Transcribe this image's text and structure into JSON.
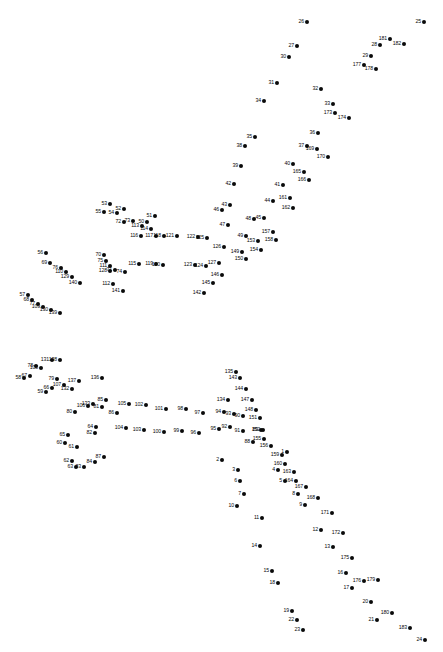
{
  "puzzle": {
    "title": "Connect the Dots",
    "dot_count": 183,
    "dot_color": "#0a0a0a",
    "background_color": "#ffffff",
    "label_color": "#0a0a0a",
    "width": 443,
    "height": 652,
    "dots": [
      {
        "n": "1",
        "x": 287,
        "y": 452,
        "pos": "l"
      },
      {
        "n": "2",
        "x": 222,
        "y": 460,
        "pos": "l"
      },
      {
        "n": "3",
        "x": 238,
        "y": 470,
        "pos": "l"
      },
      {
        "n": "4",
        "x": 278,
        "y": 470,
        "pos": "l"
      },
      {
        "n": "5",
        "x": 285,
        "y": 481,
        "pos": "l"
      },
      {
        "n": "6",
        "x": 240,
        "y": 481,
        "pos": "l"
      },
      {
        "n": "7",
        "x": 244,
        "y": 494,
        "pos": "l"
      },
      {
        "n": "8",
        "x": 298,
        "y": 494,
        "pos": "l"
      },
      {
        "n": "9",
        "x": 305,
        "y": 505,
        "pos": "l"
      },
      {
        "n": "10",
        "x": 237,
        "y": 506,
        "pos": "l"
      },
      {
        "n": "11",
        "x": 262,
        "y": 518,
        "pos": "l"
      },
      {
        "n": "12",
        "x": 321,
        "y": 530,
        "pos": "l"
      },
      {
        "n": "13",
        "x": 333,
        "y": 547,
        "pos": "l"
      },
      {
        "n": "14",
        "x": 260,
        "y": 546,
        "pos": "l"
      },
      {
        "n": "15",
        "x": 272,
        "y": 571,
        "pos": "l"
      },
      {
        "n": "16",
        "x": 346,
        "y": 573,
        "pos": "l"
      },
      {
        "n": "17",
        "x": 352,
        "y": 588,
        "pos": "l"
      },
      {
        "n": "18",
        "x": 278,
        "y": 583,
        "pos": "l"
      },
      {
        "n": "19",
        "x": 292,
        "y": 611,
        "pos": "l"
      },
      {
        "n": "20",
        "x": 371,
        "y": 602,
        "pos": "l"
      },
      {
        "n": "21",
        "x": 377,
        "y": 620,
        "pos": "l"
      },
      {
        "n": "22",
        "x": 297,
        "y": 620,
        "pos": "l"
      },
      {
        "n": "23",
        "x": 303,
        "y": 630,
        "pos": "l"
      },
      {
        "n": "24",
        "x": 425,
        "y": 640,
        "pos": "l"
      },
      {
        "n": "25",
        "x": 424,
        "y": 22,
        "pos": "l"
      },
      {
        "n": "26",
        "x": 307,
        "y": 22,
        "pos": "l"
      },
      {
        "n": "27",
        "x": 297,
        "y": 46,
        "pos": "l"
      },
      {
        "n": "28",
        "x": 380,
        "y": 45,
        "pos": "l"
      },
      {
        "n": "29",
        "x": 371,
        "y": 56,
        "pos": "l"
      },
      {
        "n": "30",
        "x": 289,
        "y": 57,
        "pos": "l"
      },
      {
        "n": "31",
        "x": 277,
        "y": 83,
        "pos": "l"
      },
      {
        "n": "32",
        "x": 321,
        "y": 89,
        "pos": "l"
      },
      {
        "n": "33",
        "x": 333,
        "y": 104,
        "pos": "l"
      },
      {
        "n": "34",
        "x": 264,
        "y": 101,
        "pos": "l"
      },
      {
        "n": "35",
        "x": 255,
        "y": 137,
        "pos": "l"
      },
      {
        "n": "36",
        "x": 318,
        "y": 133,
        "pos": "l"
      },
      {
        "n": "37",
        "x": 307,
        "y": 146,
        "pos": "l"
      },
      {
        "n": "38",
        "x": 245,
        "y": 146,
        "pos": "l"
      },
      {
        "n": "39",
        "x": 241,
        "y": 166,
        "pos": "l"
      },
      {
        "n": "40",
        "x": 293,
        "y": 164,
        "pos": "l"
      },
      {
        "n": "41",
        "x": 283,
        "y": 185,
        "pos": "l"
      },
      {
        "n": "42",
        "x": 234,
        "y": 184,
        "pos": "l"
      },
      {
        "n": "43",
        "x": 230,
        "y": 205,
        "pos": "l"
      },
      {
        "n": "44",
        "x": 273,
        "y": 201,
        "pos": "l"
      },
      {
        "n": "45",
        "x": 264,
        "y": 218,
        "pos": "l"
      },
      {
        "n": "46",
        "x": 222,
        "y": 210,
        "pos": "l"
      },
      {
        "n": "47",
        "x": 228,
        "y": 225,
        "pos": "l"
      },
      {
        "n": "48",
        "x": 254,
        "y": 219,
        "pos": "l"
      },
      {
        "n": "49",
        "x": 246,
        "y": 236,
        "pos": "l"
      },
      {
        "n": "50",
        "x": 147,
        "y": 222,
        "pos": "l"
      },
      {
        "n": "51",
        "x": 155,
        "y": 216,
        "pos": "l"
      },
      {
        "n": "52",
        "x": 124,
        "y": 209,
        "pos": "l"
      },
      {
        "n": "53",
        "x": 110,
        "y": 204,
        "pos": "l"
      },
      {
        "n": "54",
        "x": 117,
        "y": 213,
        "pos": "l"
      },
      {
        "n": "55",
        "x": 104,
        "y": 212,
        "pos": "l"
      },
      {
        "n": "56",
        "x": 46,
        "y": 253,
        "pos": "l"
      },
      {
        "n": "57",
        "x": 28,
        "y": 295,
        "pos": "l"
      },
      {
        "n": "58",
        "x": 24,
        "y": 378,
        "pos": "l"
      },
      {
        "n": "59",
        "x": 46,
        "y": 392,
        "pos": "l"
      },
      {
        "n": "60",
        "x": 65,
        "y": 443,
        "pos": "l"
      },
      {
        "n": "61",
        "x": 77,
        "y": 447,
        "pos": "l"
      },
      {
        "n": "62",
        "x": 72,
        "y": 461,
        "pos": "l"
      },
      {
        "n": "63",
        "x": 76,
        "y": 467,
        "pos": "l"
      },
      {
        "n": "64",
        "x": 96,
        "y": 427,
        "pos": "l"
      },
      {
        "n": "65",
        "x": 68,
        "y": 435,
        "pos": "l"
      },
      {
        "n": "66",
        "x": 52,
        "y": 388,
        "pos": "l"
      },
      {
        "n": "67",
        "x": 30,
        "y": 376,
        "pos": "l"
      },
      {
        "n": "68",
        "x": 32,
        "y": 300,
        "pos": "l"
      },
      {
        "n": "69",
        "x": 50,
        "y": 263,
        "pos": "l"
      },
      {
        "n": "70",
        "x": 104,
        "y": 255,
        "pos": "l"
      },
      {
        "n": "71",
        "x": 115,
        "y": 270,
        "pos": "l"
      },
      {
        "n": "72",
        "x": 124,
        "y": 222,
        "pos": "l"
      },
      {
        "n": "73",
        "x": 133,
        "y": 221,
        "pos": "l"
      },
      {
        "n": "74",
        "x": 125,
        "y": 272,
        "pos": "l"
      },
      {
        "n": "75",
        "x": 106,
        "y": 261,
        "pos": "l"
      },
      {
        "n": "76",
        "x": 61,
        "y": 268,
        "pos": "l"
      },
      {
        "n": "77",
        "x": 38,
        "y": 304,
        "pos": "l"
      },
      {
        "n": "78",
        "x": 36,
        "y": 366,
        "pos": "l"
      },
      {
        "n": "79",
        "x": 57,
        "y": 379,
        "pos": "l"
      },
      {
        "n": "80",
        "x": 75,
        "y": 412,
        "pos": "l"
      },
      {
        "n": "81",
        "x": 102,
        "y": 407,
        "pos": "l"
      },
      {
        "n": "82",
        "x": 95,
        "y": 433,
        "pos": "l"
      },
      {
        "n": "83",
        "x": 84,
        "y": 467,
        "pos": "l"
      },
      {
        "n": "84",
        "x": 95,
        "y": 462,
        "pos": "l"
      },
      {
        "n": "85",
        "x": 106,
        "y": 400,
        "pos": "l"
      },
      {
        "n": "86",
        "x": 117,
        "y": 413,
        "pos": "l"
      },
      {
        "n": "87",
        "x": 104,
        "y": 457,
        "pos": "l"
      },
      {
        "n": "88",
        "x": 253,
        "y": 442,
        "pos": "l"
      },
      {
        "n": "89",
        "x": 261,
        "y": 430,
        "pos": "l"
      },
      {
        "n": "90",
        "x": 243,
        "y": 416,
        "pos": "l"
      },
      {
        "n": "91",
        "x": 243,
        "y": 431,
        "pos": "l"
      },
      {
        "n": "92",
        "x": 230,
        "y": 427,
        "pos": "l"
      },
      {
        "n": "93",
        "x": 234,
        "y": 414,
        "pos": "l"
      },
      {
        "n": "94",
        "x": 224,
        "y": 412,
        "pos": "l"
      },
      {
        "n": "95",
        "x": 219,
        "y": 429,
        "pos": "l"
      },
      {
        "n": "96",
        "x": 199,
        "y": 433,
        "pos": "l"
      },
      {
        "n": "97",
        "x": 203,
        "y": 413,
        "pos": "l"
      },
      {
        "n": "98",
        "x": 186,
        "y": 409,
        "pos": "l"
      },
      {
        "n": "99",
        "x": 182,
        "y": 431,
        "pos": "l"
      },
      {
        "n": "100",
        "x": 164,
        "y": 432,
        "pos": "l"
      },
      {
        "n": "101",
        "x": 166,
        "y": 409,
        "pos": "l"
      },
      {
        "n": "102",
        "x": 146,
        "y": 405,
        "pos": "l"
      },
      {
        "n": "103",
        "x": 144,
        "y": 430,
        "pos": "l"
      },
      {
        "n": "104",
        "x": 126,
        "y": 428,
        "pos": "l"
      },
      {
        "n": "105",
        "x": 129,
        "y": 404,
        "pos": "l"
      },
      {
        "n": "106",
        "x": 88,
        "y": 406,
        "pos": "l"
      },
      {
        "n": "107",
        "x": 64,
        "y": 385,
        "pos": "l"
      },
      {
        "n": "108",
        "x": 41,
        "y": 368,
        "pos": "l"
      },
      {
        "n": "109",
        "x": 43,
        "y": 307,
        "pos": "l"
      },
      {
        "n": "110",
        "x": 66,
        "y": 272,
        "pos": "l"
      },
      {
        "n": "111",
        "x": 110,
        "y": 266,
        "pos": "l"
      },
      {
        "n": "112",
        "x": 113,
        "y": 284,
        "pos": "l"
      },
      {
        "n": "113",
        "x": 142,
        "y": 226,
        "pos": "l"
      },
      {
        "n": "114",
        "x": 151,
        "y": 229,
        "pos": "l"
      },
      {
        "n": "115",
        "x": 139,
        "y": 264,
        "pos": "l"
      },
      {
        "n": "116",
        "x": 141,
        "y": 236,
        "pos": "l"
      },
      {
        "n": "117",
        "x": 156,
        "y": 236,
        "pos": "l"
      },
      {
        "n": "118",
        "x": 164,
        "y": 236,
        "pos": "l"
      },
      {
        "n": "119",
        "x": 156,
        "y": 264,
        "pos": "l"
      },
      {
        "n": "120",
        "x": 163,
        "y": 265,
        "pos": "l"
      },
      {
        "n": "121",
        "x": 177,
        "y": 236,
        "pos": "l"
      },
      {
        "n": "122",
        "x": 198,
        "y": 237,
        "pos": "l"
      },
      {
        "n": "123",
        "x": 195,
        "y": 265,
        "pos": "l"
      },
      {
        "n": "124",
        "x": 206,
        "y": 266,
        "pos": "l"
      },
      {
        "n": "125",
        "x": 207,
        "y": 238,
        "pos": "l"
      },
      {
        "n": "126",
        "x": 224,
        "y": 247,
        "pos": "l"
      },
      {
        "n": "127",
        "x": 219,
        "y": 263,
        "pos": "l"
      },
      {
        "n": "128",
        "x": 110,
        "y": 271,
        "pos": "l"
      },
      {
        "n": "129",
        "x": 72,
        "y": 277,
        "pos": "l"
      },
      {
        "n": "130",
        "x": 51,
        "y": 310,
        "pos": "l"
      },
      {
        "n": "131",
        "x": 52,
        "y": 360,
        "pos": "l"
      },
      {
        "n": "132",
        "x": 72,
        "y": 389,
        "pos": "l"
      },
      {
        "n": "133",
        "x": 93,
        "y": 404,
        "pos": "l"
      },
      {
        "n": "134",
        "x": 228,
        "y": 400,
        "pos": "l"
      },
      {
        "n": "135",
        "x": 236,
        "y": 372,
        "pos": "l"
      },
      {
        "n": "136",
        "x": 102,
        "y": 378,
        "pos": "l"
      },
      {
        "n": "137",
        "x": 79,
        "y": 381,
        "pos": "l"
      },
      {
        "n": "138",
        "x": 60,
        "y": 360,
        "pos": "l"
      },
      {
        "n": "139",
        "x": 60,
        "y": 313,
        "pos": "l"
      },
      {
        "n": "140",
        "x": 80,
        "y": 283,
        "pos": "l"
      },
      {
        "n": "141",
        "x": 123,
        "y": 291,
        "pos": "l"
      },
      {
        "n": "142",
        "x": 204,
        "y": 293,
        "pos": "l"
      },
      {
        "n": "143",
        "x": 240,
        "y": 378,
        "pos": "l"
      },
      {
        "n": "144",
        "x": 246,
        "y": 389,
        "pos": "l"
      },
      {
        "n": "145",
        "x": 213,
        "y": 283,
        "pos": "l"
      },
      {
        "n": "146",
        "x": 222,
        "y": 275,
        "pos": "l"
      },
      {
        "n": "147",
        "x": 252,
        "y": 400,
        "pos": "l"
      },
      {
        "n": "148",
        "x": 256,
        "y": 410,
        "pos": "l"
      },
      {
        "n": "149",
        "x": 242,
        "y": 252,
        "pos": "l"
      },
      {
        "n": "150",
        "x": 246,
        "y": 259,
        "pos": "l"
      },
      {
        "n": "151",
        "x": 260,
        "y": 418,
        "pos": "l"
      },
      {
        "n": "152",
        "x": 263,
        "y": 430,
        "pos": "l"
      },
      {
        "n": "153",
        "x": 258,
        "y": 241,
        "pos": "l"
      },
      {
        "n": "154",
        "x": 261,
        "y": 250,
        "pos": "l"
      },
      {
        "n": "155",
        "x": 264,
        "y": 439,
        "pos": "l"
      },
      {
        "n": "156",
        "x": 271,
        "y": 446,
        "pos": "l"
      },
      {
        "n": "157",
        "x": 273,
        "y": 232,
        "pos": "l"
      },
      {
        "n": "158",
        "x": 276,
        "y": 240,
        "pos": "l"
      },
      {
        "n": "159",
        "x": 282,
        "y": 455,
        "pos": "l"
      },
      {
        "n": "160",
        "x": 285,
        "y": 464,
        "pos": "l"
      },
      {
        "n": "161",
        "x": 290,
        "y": 198,
        "pos": "l"
      },
      {
        "n": "162",
        "x": 293,
        "y": 208,
        "pos": "l"
      },
      {
        "n": "163",
        "x": 294,
        "y": 472,
        "pos": "l"
      },
      {
        "n": "164",
        "x": 296,
        "y": 481,
        "pos": "l"
      },
      {
        "n": "165",
        "x": 304,
        "y": 172,
        "pos": "l"
      },
      {
        "n": "166",
        "x": 309,
        "y": 180,
        "pos": "l"
      },
      {
        "n": "167",
        "x": 306,
        "y": 487,
        "pos": "l"
      },
      {
        "n": "168",
        "x": 318,
        "y": 498,
        "pos": "l"
      },
      {
        "n": "169",
        "x": 317,
        "y": 149,
        "pos": "l"
      },
      {
        "n": "170",
        "x": 328,
        "y": 157,
        "pos": "l"
      },
      {
        "n": "171",
        "x": 332,
        "y": 513,
        "pos": "l"
      },
      {
        "n": "172",
        "x": 343,
        "y": 533,
        "pos": "l"
      },
      {
        "n": "173",
        "x": 335,
        "y": 113,
        "pos": "l"
      },
      {
        "n": "174",
        "x": 349,
        "y": 118,
        "pos": "l"
      },
      {
        "n": "175",
        "x": 352,
        "y": 558,
        "pos": "l"
      },
      {
        "n": "176",
        "x": 364,
        "y": 581,
        "pos": "l"
      },
      {
        "n": "177",
        "x": 364,
        "y": 65,
        "pos": "l"
      },
      {
        "n": "178",
        "x": 376,
        "y": 69,
        "pos": "l"
      },
      {
        "n": "179",
        "x": 378,
        "y": 580,
        "pos": "l"
      },
      {
        "n": "180",
        "x": 392,
        "y": 613,
        "pos": "l"
      },
      {
        "n": "181",
        "x": 390,
        "y": 39,
        "pos": "l"
      },
      {
        "n": "182",
        "x": 404,
        "y": 44,
        "pos": "l"
      },
      {
        "n": "183",
        "x": 410,
        "y": 628,
        "pos": "l"
      }
    ]
  }
}
